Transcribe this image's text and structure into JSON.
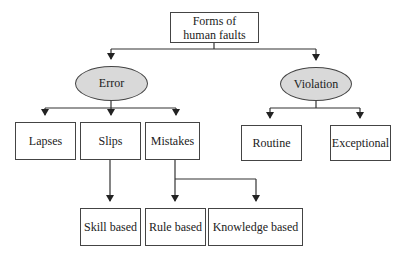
{
  "diagram": {
    "type": "tree",
    "root": {
      "id": "root",
      "label_line1": "Forms of",
      "label_line2": "human faults"
    },
    "categories": [
      {
        "id": "error",
        "label": "Error",
        "shape": "ellipse",
        "fill": "#d9d9d9"
      },
      {
        "id": "violation",
        "label": "Violation",
        "shape": "ellipse",
        "fill": "#d9d9d9"
      }
    ],
    "error_children": [
      {
        "id": "lapses",
        "label": "Lapses"
      },
      {
        "id": "slips",
        "label": "Slips"
      },
      {
        "id": "mistakes",
        "label": "Mistakes"
      }
    ],
    "violation_children": [
      {
        "id": "routine",
        "label": "Routine"
      },
      {
        "id": "exceptional",
        "label": "Exceptional"
      }
    ],
    "leaves": [
      {
        "id": "skill",
        "label": "Skill based",
        "parent": "slips"
      },
      {
        "id": "rule",
        "label": "Rule based",
        "parent": "mistakes"
      },
      {
        "id": "knowledge",
        "label": "Knowledge based",
        "parent": "mistakes"
      }
    ],
    "edges": [
      [
        "root",
        "error"
      ],
      [
        "root",
        "violation"
      ],
      [
        "error",
        "lapses"
      ],
      [
        "error",
        "slips"
      ],
      [
        "error",
        "mistakes"
      ],
      [
        "violation",
        "routine"
      ],
      [
        "violation",
        "exceptional"
      ],
      [
        "slips",
        "skill"
      ],
      [
        "mistakes",
        "rule"
      ],
      [
        "mistakes",
        "knowledge"
      ]
    ]
  }
}
